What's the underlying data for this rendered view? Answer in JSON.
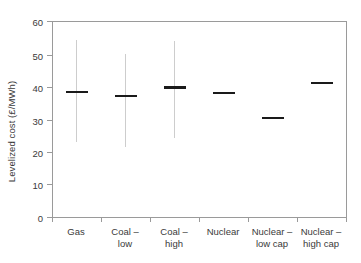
{
  "chart_data": {
    "type": "bar",
    "title": "",
    "xlabel": "",
    "ylabel": "Levelized cost (£/MWh)",
    "ylim": [
      0,
      60
    ],
    "yticks": [
      0,
      10,
      20,
      30,
      40,
      50,
      60
    ],
    "ytick_labels": [
      "0",
      "10",
      "20",
      "30",
      "40",
      "50",
      "60"
    ],
    "grid": false,
    "legend": "none",
    "categories": [
      "Gas",
      "Coal – low",
      "Coal – high",
      "Nuclear",
      "Nuclear – low cap",
      "Nuclear – high cap"
    ],
    "category_lines": [
      [
        "Gas",
        ""
      ],
      [
        "Coal –",
        "low"
      ],
      [
        "Coal –",
        "high"
      ],
      [
        "Nuclear",
        ""
      ],
      [
        "Nuclear –",
        "low cap"
      ],
      [
        "Nuclear –",
        "high cap"
      ]
    ],
    "values": [
      38.4,
      37.2,
      39.8,
      38.1,
      30.5,
      41.1
    ],
    "series": [
      {
        "name": "Central estimate",
        "values": [
          38.4,
          37.2,
          39.8,
          38.1,
          30.5,
          41.1
        ]
      },
      {
        "name": "Range low",
        "values": [
          23.2,
          21.7,
          24.4,
          null,
          null,
          null
        ]
      },
      {
        "name": "Range high",
        "values": [
          54.2,
          49.9,
          53.9,
          null,
          null,
          null
        ]
      }
    ],
    "marker_color": "#1a1a1a",
    "whisker_color": "#cdcdcd",
    "axis_color": "#9a9a9a",
    "background_color": "#ffffff"
  }
}
